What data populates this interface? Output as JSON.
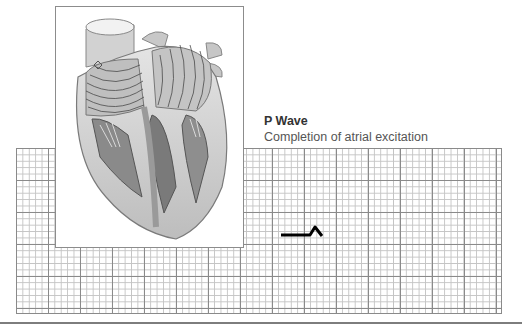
{
  "label": {
    "title": "P Wave",
    "subtitle": "Completion of atrial excitation"
  },
  "illustration": {
    "subject": "heart-cross-section",
    "description": "Cutaway heart with concentric excitation wavefront lines spreading across atria"
  },
  "ecg_grid": {
    "minor_cell_px": 6.4,
    "major_every": 5,
    "minor_color": "#c4c4c4",
    "major_color": "#8a8a8a"
  },
  "waveform": {
    "segment": "P wave (start)",
    "color": "#000000"
  }
}
